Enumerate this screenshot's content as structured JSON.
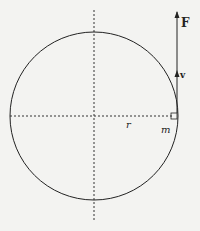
{
  "diagram": {
    "labels": {
      "force": "F",
      "velocity": "v",
      "radius": "r",
      "mass": "m"
    },
    "colors": {
      "background": "#f3f3f1",
      "stroke": "#222222"
    }
  }
}
